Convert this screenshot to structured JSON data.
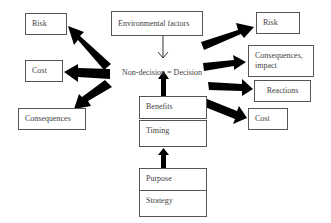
{
  "diagram": {
    "center_label": "Non-decision = Decision",
    "top_input": "Environmental factors",
    "left_outcomes": [
      {
        "label": "Risk"
      },
      {
        "label": "Cost"
      },
      {
        "label": "Consequences"
      }
    ],
    "right_outcomes": [
      {
        "label": "Risk"
      },
      {
        "label": "Consequences, impact"
      },
      {
        "label": "Reactions"
      },
      {
        "label": "Cost"
      }
    ],
    "upper_stack": [
      {
        "label": "Benefits"
      },
      {
        "label": "Timing"
      }
    ],
    "lower_stack": [
      {
        "label": "Purpose"
      },
      {
        "label": "Strategy"
      }
    ],
    "colors": {
      "arrow": "#000000",
      "box_border": "#555555",
      "text": "#444444",
      "background": "#ffffff"
    }
  }
}
